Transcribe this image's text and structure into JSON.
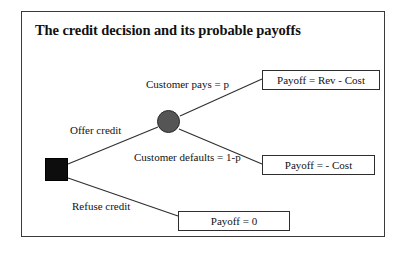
{
  "figure": {
    "title": "The credit decision and its probable payoffs",
    "type": "decision-tree",
    "frame": {
      "border_color": "#3a3a3a",
      "background": "#ffffff"
    }
  },
  "nodes": {
    "decision": {
      "name": "credit decision",
      "shape": "square",
      "fill": "#0d0d0d"
    },
    "chance": {
      "name": "customer outcome",
      "shape": "circle",
      "fill": "#555555"
    }
  },
  "branches": [
    {
      "id": "offer-credit",
      "label": "Offer credit",
      "from": "decision",
      "to": "chance"
    },
    {
      "id": "refuse-credit",
      "label": "Refuse credit",
      "from": "decision",
      "to": "payoff-zero"
    },
    {
      "id": "customer-pays",
      "label": "Customer pays = p",
      "from": "chance",
      "to": "payoff-rev-cost"
    },
    {
      "id": "customer-defaults",
      "label": "Customer defaults = 1-p",
      "from": "chance",
      "to": "payoff-neg-cost"
    }
  ],
  "payoffs": [
    {
      "id": "payoff-rev-cost",
      "label": "Payoff = Rev - Cost"
    },
    {
      "id": "payoff-neg-cost",
      "label": "Payoff = - Cost"
    },
    {
      "id": "payoff-zero",
      "label": "Payoff = 0"
    }
  ]
}
